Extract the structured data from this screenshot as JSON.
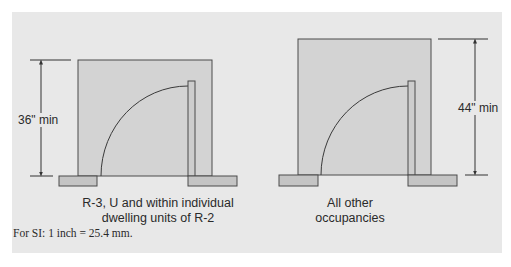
{
  "figure": {
    "diagrams": [
      {
        "id": "left",
        "dimension_label": "36\" min",
        "caption_line1": "R-3, U and within individual",
        "caption_line2": "dwelling units of R-2"
      },
      {
        "id": "right",
        "dimension_label": "44\" min",
        "caption_line1": "All other",
        "caption_line2": "occupancies"
      }
    ],
    "footnote": "For SI: 1 inch = 25.4 mm."
  },
  "colors": {
    "background_panel": "#e8e8e8",
    "frame_fill": "#d3d3d3",
    "block_fill": "#c4c4c4",
    "stroke": "#4a4a4a"
  }
}
